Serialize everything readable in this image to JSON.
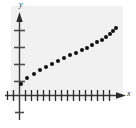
{
  "figure": {
    "background_color": "#ffffff",
    "plot_background_color": "#f1f1f1",
    "axis_color": "#3a3a3a",
    "point_color": "#111111"
  },
  "labels": {
    "x_axis": "x",
    "y_axis": "y"
  },
  "chart_data": {
    "type": "scatter",
    "title": "",
    "subtitle": "",
    "xlabel": "x",
    "ylabel": "y",
    "grid": false,
    "legend": null,
    "xlim": [
      -1,
      18
    ],
    "ylim": [
      -1.5,
      5
    ],
    "x_ticks": [
      1,
      2,
      3,
      4,
      5,
      6,
      7,
      8,
      9,
      10,
      11,
      12,
      13,
      14,
      15,
      16,
      17
    ],
    "y_ticks": [
      -1,
      1,
      2,
      3,
      4
    ],
    "x_tick_labels": [],
    "y_tick_labels": [],
    "series": [
      {
        "name": "data",
        "x": [
          0.35,
          1.1,
          1.9,
          2.7,
          3.5,
          4.35,
          5.2,
          6.05,
          6.9,
          7.75,
          8.6,
          9.45,
          10.3,
          11.15,
          12.0,
          12.85,
          13.7,
          14.55,
          15.4
        ],
        "y": [
          0.55,
          1.05,
          1.35,
          1.6,
          1.8,
          1.95,
          2.1,
          2.25,
          2.4,
          2.5,
          2.6,
          2.7,
          2.8,
          2.9,
          2.98,
          3.06,
          3.14,
          3.2,
          3.28
        ]
      }
    ],
    "points_px": [
      [
        21,
        84
      ],
      [
        27,
        78
      ],
      [
        34,
        74
      ],
      [
        40,
        70
      ],
      [
        46,
        67
      ],
      [
        52,
        64
      ],
      [
        58,
        61
      ],
      [
        64,
        58
      ],
      [
        70,
        55
      ],
      [
        76,
        53
      ],
      [
        82,
        50
      ],
      [
        87,
        48
      ],
      [
        92,
        45
      ],
      [
        97,
        42
      ],
      [
        102,
        40
      ],
      [
        106,
        37
      ],
      [
        110,
        34
      ],
      [
        113,
        31
      ],
      [
        116,
        28
      ]
    ],
    "axis_geometry_px": {
      "y_axis_x": 19,
      "x_axis_y": 95,
      "x_tick_spacing": 6,
      "y_tick_spacing": 17,
      "x_tick_count": 17,
      "y_ticks_above": 4,
      "y_ticks_below": 1
    }
  }
}
